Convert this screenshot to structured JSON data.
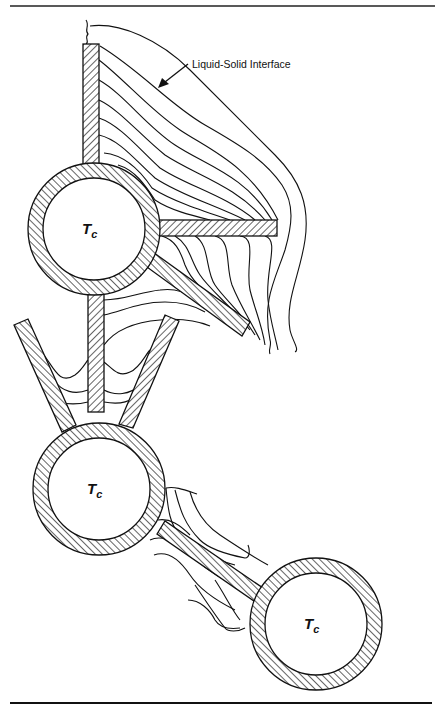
{
  "figure": {
    "type": "cross-section diagram of cooled tubes with fins and solidification front contours",
    "annotation": {
      "label": "Liquid-Solid Interface",
      "arrow": "pointer from label to outermost contour of upper tube assembly"
    },
    "tubes": [
      {
        "id": "tube-1",
        "label_main": "T",
        "label_sub": "c",
        "fins": [
          "vertical-up",
          "horizontal-right",
          "diagonal-down-right",
          "vertical-down"
        ]
      },
      {
        "id": "tube-2",
        "label_main": "T",
        "label_sub": "c",
        "fins": [
          "v-left",
          "v-right"
        ]
      },
      {
        "id": "tube-3",
        "label_main": "T",
        "label_sub": "c",
        "fins": [
          "diagonal-up-left"
        ]
      }
    ],
    "rules": {
      "top": true,
      "bottom": true
    },
    "colors": {
      "ink": "#111111",
      "background": "#ffffff"
    }
  }
}
